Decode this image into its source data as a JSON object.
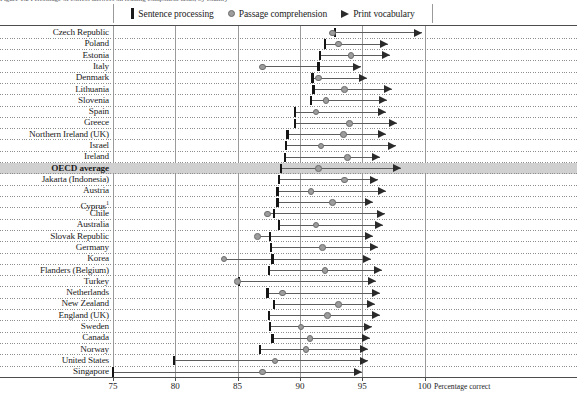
{
  "top_clipped_text": "Figure 1.2  Percentage of correct answers on reading component tasks, by country",
  "legend": {
    "items": [
      {
        "label": "Sentence processing",
        "icon": "bar-marker-icon",
        "color": "#1a1a1a"
      },
      {
        "label": "Passage comprehension",
        "icon": "circle-marker-icon",
        "color": "#9d9d9d"
      },
      {
        "label": "Print vocabulary",
        "icon": "triangle-marker-icon",
        "color": "#2b2b2b"
      }
    ]
  },
  "axis": {
    "title": "Percentage correct",
    "ticks": [
      75,
      80,
      85,
      90,
      95,
      100
    ],
    "min": 73.0,
    "max": 110.0
  },
  "highlight_row": "OECD average",
  "chart_data": {
    "type": "scatter",
    "title": "Percentage of correct answers on reading component tasks, by country",
    "xlabel": "Percentage correct",
    "ylabel": "",
    "xlim": [
      73.0,
      110.0
    ],
    "grid": true,
    "legend_position": "top",
    "series_names": [
      "Sentence processing",
      "Passage comprehension",
      "Print vocabulary"
    ],
    "categories": [
      "Czech Republic",
      "Poland",
      "Estonia",
      "Italy",
      "Denmark",
      "Lithuania",
      "Slovenia",
      "Spain",
      "Greece",
      "Northern Ireland (UK)",
      "Israel",
      "Ireland",
      "OECD average",
      "Jakarta (Indonesia)",
      "Austria",
      "Cyprus¹",
      "Chile",
      "Australia",
      "Slovak Republic",
      "Germany",
      "Korea",
      "Flanders (Belgium)",
      "Turkey",
      "Netherlands",
      "New Zealand",
      "England (UK)",
      "Sweden",
      "Canada",
      "Norway",
      "United States",
      "Singapore"
    ],
    "series": [
      {
        "name": "Sentence processing",
        "values": [
          92.8,
          92.0,
          91.6,
          91.5,
          91.0,
          91.1,
          90.9,
          89.6,
          89.6,
          89.0,
          88.9,
          88.8,
          88.5,
          88.3,
          88.2,
          88.2,
          87.9,
          88.3,
          87.6,
          87.7,
          87.8,
          87.5,
          85.1,
          87.4,
          87.9,
          87.5,
          87.6,
          87.8,
          86.8,
          79.9,
          75.0
        ]
      },
      {
        "name": "Passage comprehension",
        "values": [
          92.6,
          93.1,
          94.1,
          87.0,
          91.5,
          93.6,
          92.1,
          91.3,
          94.0,
          93.5,
          91.7,
          93.8,
          91.5,
          93.6,
          90.9,
          92.6,
          87.4,
          91.3,
          86.6,
          91.8,
          83.9,
          92.0,
          85.0,
          88.6,
          93.1,
          92.2,
          90.1,
          90.8,
          90.5,
          88.0,
          87.0
        ]
      },
      {
        "name": "Print vocabulary",
        "values": [
          99.8,
          97.1,
          97.2,
          94.9,
          95.4,
          97.4,
          97.0,
          96.9,
          97.8,
          96.9,
          97.7,
          96.4,
          98.1,
          96.3,
          96.9,
          95.9,
          96.8,
          96.7,
          95.9,
          96.3,
          95.7,
          96.6,
          96.1,
          96.4,
          96.0,
          96.4,
          95.8,
          95.6,
          95.5,
          95.5,
          95.0
        ]
      }
    ]
  }
}
